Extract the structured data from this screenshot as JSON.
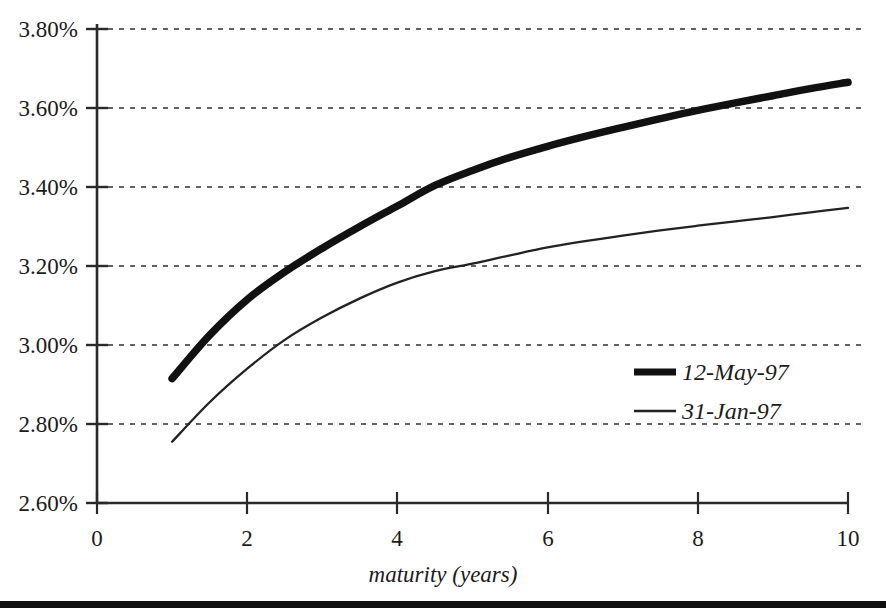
{
  "chart_data": {
    "type": "line",
    "title": "",
    "xlabel": "maturity (years)",
    "ylabel": "",
    "xlim": [
      0,
      10
    ],
    "ylim": [
      2.6,
      3.8
    ],
    "grid": true,
    "grid_axis": "y",
    "grid_style": "dotted",
    "legend_position": "center-right-inside",
    "x_tick_labels": [
      "0",
      "2",
      "4",
      "6",
      "8",
      "10"
    ],
    "x_ticks": [
      0,
      2,
      4,
      6,
      8,
      10
    ],
    "y_tick_labels": [
      "3.80%",
      "3.60%",
      "3.40%",
      "3.20%",
      "3.00%",
      "2.80%",
      "2.60%"
    ],
    "y_ticks": [
      3.8,
      3.6,
      3.4,
      3.2,
      3.0,
      2.8,
      2.6
    ],
    "x": [
      1,
      1.5,
      2,
      2.5,
      3,
      3.5,
      4,
      4.5,
      5,
      5.5,
      6,
      6.5,
      7,
      7.5,
      8,
      8.5,
      9,
      9.5,
      10
    ],
    "series": [
      {
        "name": "12-May-97",
        "line_width": "thick",
        "color": "#111111",
        "values": [
          2.915,
          3.025,
          3.115,
          3.185,
          3.245,
          3.3,
          3.352,
          3.404,
          3.442,
          3.475,
          3.503,
          3.528,
          3.551,
          3.573,
          3.594,
          3.613,
          3.631,
          3.649,
          3.665
        ]
      },
      {
        "name": "31-Jan-97",
        "line_width": "thin",
        "color": "#222222",
        "values": [
          2.755,
          2.855,
          2.94,
          3.013,
          3.07,
          3.118,
          3.158,
          3.187,
          3.206,
          3.227,
          3.247,
          3.263,
          3.277,
          3.29,
          3.302,
          3.313,
          3.324,
          3.336,
          3.347
        ]
      }
    ]
  },
  "legend": {
    "entries": [
      {
        "label": "12-May-97",
        "swatch": "thick-line-swatch"
      },
      {
        "label": "31-Jan-97",
        "swatch": "thin-line-swatch"
      }
    ]
  },
  "axes": {
    "x_title": "maturity (years)"
  },
  "colors": {
    "ink": "#1b1b1b",
    "axis": "#2a2a2a",
    "grid": "#2f2f2f",
    "rule": "#101010"
  }
}
